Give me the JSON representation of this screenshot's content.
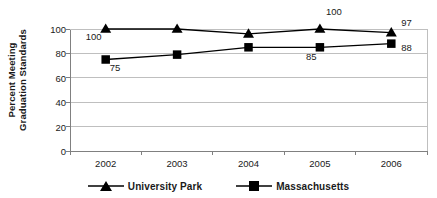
{
  "chart_data": {
    "type": "line",
    "title": "",
    "subtitle": "",
    "xlabel": "",
    "ylabel": "Percent Meeting Graduation Standards",
    "ylabel_lines": [
      "Percent Meeting",
      "Graduation Standards"
    ],
    "categories": [
      "2002",
      "2003",
      "2004",
      "2005",
      "2006"
    ],
    "x_tick_labels": [
      "2002",
      "2003",
      "2004",
      "2005",
      "2006"
    ],
    "y_tick_labels": [
      "0",
      "20",
      "40",
      "60",
      "80",
      "100"
    ],
    "y_ticks": [
      0,
      20,
      40,
      60,
      80,
      100
    ],
    "ylim": [
      0,
      100
    ],
    "grid": "horizontal",
    "legend_position": "bottom",
    "series": [
      {
        "name": "University Park",
        "marker": "triangle",
        "color": "#000000",
        "values": [
          100,
          100,
          96,
          100,
          97
        ],
        "point_labels": [
          "100",
          "",
          "",
          "100",
          "97"
        ]
      },
      {
        "name": "Massachusetts",
        "marker": "square",
        "color": "#000000",
        "values": [
          75,
          79,
          85,
          85,
          88
        ],
        "point_labels": [
          "75",
          "",
          "",
          "85",
          "88"
        ]
      }
    ],
    "annotations": [
      {
        "text": "100",
        "series": "University Park",
        "category": "2002",
        "value": 100
      },
      {
        "text": "75",
        "series": "Massachusetts",
        "category": "2002",
        "value": 75
      },
      {
        "text": "100",
        "series": "University Park",
        "category": "2005",
        "value": 100
      },
      {
        "text": "85",
        "series": "Massachusetts",
        "category": "2005",
        "value": 85
      },
      {
        "text": "97",
        "series": "University Park",
        "category": "2006",
        "value": 97
      },
      {
        "text": "88",
        "series": "Massachusetts",
        "category": "2006",
        "value": 88
      }
    ],
    "colors": {
      "background": "#ffffff",
      "axis": "#808080",
      "gridline": "#bfbfbf",
      "series_line": "#000000",
      "text": "#1a1a1a"
    }
  },
  "legend": {
    "items": [
      {
        "label": "University Park",
        "marker": "triangle"
      },
      {
        "label": "Massachusetts",
        "marker": "square"
      }
    ]
  }
}
